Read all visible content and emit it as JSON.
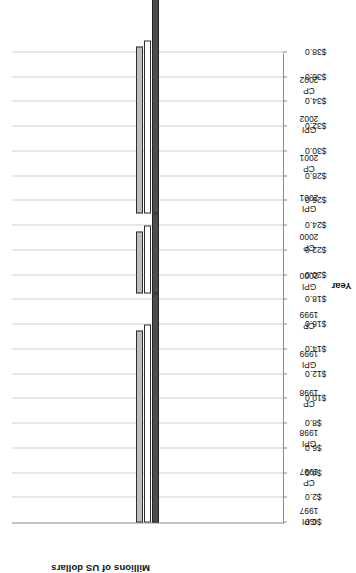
{
  "chart_data": {
    "type": "bar",
    "orientation": "horizontal",
    "title": "",
    "xlabel": "Year",
    "ylabel": "Millions of US dollars",
    "ylim": [
      0,
      38
    ],
    "ytick_step": 2,
    "ytick_labels": [
      "$0.0",
      "$2.0",
      "$4.0",
      "$6.0",
      "$8.0",
      "$10.0",
      "$12.0",
      "$14.0",
      "$16.0",
      "$18.0",
      "$20.0",
      "$22.0",
      "$24.0",
      "$26.0",
      "$28.0",
      "$30.0",
      "$32.0",
      "$34.0",
      "$36.0",
      "$38.0"
    ],
    "grid": true,
    "legend": "none",
    "categories": [
      {
        "l1": "GPI",
        "l2": "1997"
      },
      {
        "l1": "CP",
        "l2": "1997"
      },
      {
        "l1": "GPI",
        "l2": "1998"
      },
      {
        "l1": "CP",
        "l2": "1998"
      },
      {
        "l1": "GPI",
        "l2": "1999"
      },
      {
        "l1": "CP",
        "l2": "1999"
      },
      {
        "l1": "GPI",
        "l2": "2000"
      },
      {
        "l1": "CP",
        "l2": "2000"
      },
      {
        "l1": "GPI",
        "l2": "2001"
      },
      {
        "l1": "CP",
        "l2": "2001"
      },
      {
        "l1": "GPI",
        "l2": "2002"
      },
      {
        "l1": "CP",
        "l2": "2002"
      }
    ],
    "series": [
      {
        "name": "series-1",
        "color": "#4d4d4d",
        "values": [
          18.5,
          6.5,
          17.5,
          7.5,
          23.0,
          12.0,
          22.0,
          11.0,
          24.0,
          13.5,
          37.5,
          23.0
        ]
      },
      {
        "name": "series-2",
        "color": "#ffffff",
        "values": [
          16.0,
          5.5,
          14.0,
          6.5,
          22.0,
          11.0,
          23.5,
          12.5,
          23.5,
          15.0,
          35.5,
          24.0
        ]
      },
      {
        "name": "series-3",
        "color": "#bfbfbf",
        "values": [
          15.5,
          5.0,
          13.5,
          6.0,
          24.5,
          12.0,
          24.0,
          13.0,
          24.0,
          15.5,
          35.0,
          24.5
        ]
      }
    ]
  },
  "colors": {
    "series_1": "#4d4d4d",
    "series_2": "#ffffff",
    "series_3": "#bfbfbf",
    "axis": "#8a8a8a",
    "grid": "#d0d0d0",
    "text": "#111111",
    "background": "#ffffff"
  }
}
